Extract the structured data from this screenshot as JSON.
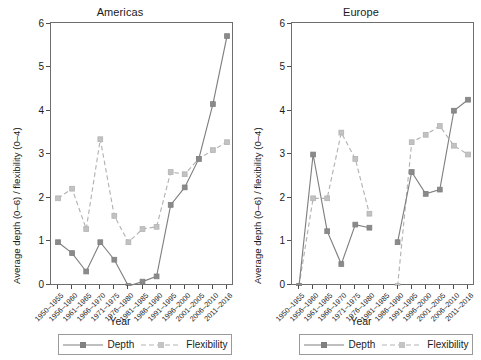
{
  "figure": {
    "panels": [
      "Americas",
      "Europe"
    ],
    "shared_ylabel": "Average depth (0–6) / flexibility (0–4)",
    "shared_xlabel": "Year",
    "legend": {
      "depth_label": "Depth",
      "flexibility_label": "Flexibility"
    },
    "colors": {
      "depth": "#808080",
      "flexibility": "#b3b3b3",
      "axis": "#6e6e6e",
      "text": "#1a1a1a",
      "background": "#ffffff"
    }
  },
  "chart_data": [
    {
      "type": "line",
      "title": "Americas",
      "xlabel": "Year",
      "ylabel": "Average depth (0–6) / flexibility (0–4)",
      "ylim": [
        0,
        6
      ],
      "yticks": [
        0,
        1,
        2,
        3,
        4,
        5,
        6
      ],
      "grid": false,
      "legend_position": "below-axes",
      "categories": [
        "1950–1955",
        "1956–1960",
        "1961–1965",
        "1966–1970",
        "1971–1975",
        "1976–1980",
        "1981–1985",
        "1986–1990",
        "1991–1995",
        "1996–2000",
        "2001–2005",
        "2006–2010",
        "2011–2016"
      ],
      "series": [
        {
          "name": "Depth",
          "style": "solid",
          "values": [
            1.0,
            0.75,
            0.33,
            1.0,
            0.6,
            0.0,
            0.1,
            0.22,
            1.85,
            2.25,
            2.55,
            2.9,
            4.15,
            5.7
          ]
        },
        {
          "name": "Flexibility",
          "style": "dashed",
          "values": [
            2.0,
            2.22,
            1.3,
            3.35,
            1.6,
            1.0,
            1.3,
            1.35,
            2.6,
            2.55,
            2.9,
            3.05,
            3.1,
            3.28
          ]
        }
      ],
      "series_values_note": "values arrays are indexed 1:1 with categories where length matches",
      "depth": [
        1.0,
        0.75,
        0.33,
        1.0,
        0.6,
        0.0,
        0.1,
        0.22,
        1.85,
        2.25,
        2.9,
        4.15,
        5.7
      ],
      "flexibility": [
        2.0,
        2.22,
        1.3,
        3.35,
        1.6,
        1.0,
        1.3,
        1.35,
        2.6,
        2.55,
        2.9,
        3.1,
        3.28
      ]
    },
    {
      "type": "line",
      "title": "Europe",
      "xlabel": "Year",
      "ylabel": "Average depth (0–6) / flexibility (0–4)",
      "ylim": [
        0,
        6
      ],
      "yticks": [
        0,
        1,
        2,
        3,
        4,
        5,
        6
      ],
      "grid": false,
      "legend_position": "below-axes",
      "categories": [
        "1950–1955",
        "1956–1960",
        "1961–1965",
        "1966–1970",
        "1971–1975",
        "1976–1980",
        "1981–1985",
        "1986–1990",
        "1991–1995",
        "1996–2000",
        "2001–2005",
        "2006–2010",
        "2011–2016"
      ],
      "depth": [
        0.0,
        3.0,
        1.25,
        0.5,
        1.4,
        1.33,
        null,
        1.0,
        2.6,
        2.1,
        2.2,
        4.0,
        4.25
      ],
      "flexibility": [
        0.0,
        2.0,
        2.0,
        3.5,
        2.9,
        1.65,
        null,
        0.0,
        3.28,
        3.45,
        3.65,
        3.2,
        3.0
      ]
    }
  ]
}
